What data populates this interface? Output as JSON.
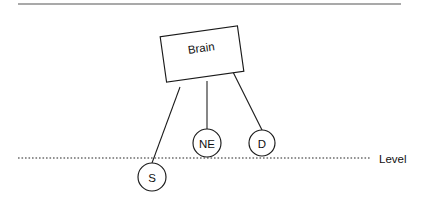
{
  "figure": {
    "background_color": "#ffffff",
    "stroke_color": "#1a1a1a",
    "text_color": "#111111",
    "width": 421,
    "height": 207
  },
  "top_rule": {
    "name": "top-divider",
    "color": "#8d8d8d",
    "x1": 18,
    "y1": 4,
    "x2": 401,
    "y2": 4
  },
  "brain_box": {
    "label": "Brain",
    "rotation_deg": -8,
    "center_x": 202,
    "center_y": 54,
    "width": 78,
    "height": 46,
    "fill": "#ffffff",
    "stroke": "#1a1a1a"
  },
  "nodes": [
    {
      "id": "S",
      "label": "S",
      "cx": 152,
      "cy": 177,
      "r": 14,
      "position_vs_level": "below",
      "fill": "#ffffff",
      "stroke": "#1a1a1a"
    },
    {
      "id": "NE",
      "label": "NE",
      "cx": 207,
      "cy": 143,
      "r": 14,
      "position_vs_level": "above",
      "fill": "#ffffff",
      "stroke": "#1a1a1a"
    },
    {
      "id": "D",
      "label": "D",
      "cx": 262,
      "cy": 143,
      "r": 13,
      "position_vs_level": "above",
      "fill": "#ffffff",
      "stroke": "#1a1a1a"
    }
  ],
  "links": [
    {
      "from": "Brain",
      "to": "S",
      "x1": 180,
      "y1": 87,
      "x2": 152,
      "y2": 163
    },
    {
      "from": "Brain",
      "to": "NE",
      "x1": 207,
      "y1": 81,
      "x2": 207,
      "y2": 129
    },
    {
      "from": "Brain",
      "to": "D",
      "x1": 233,
      "y1": 72,
      "x2": 262,
      "y2": 130
    }
  ],
  "level": {
    "label": "Level",
    "y": 158,
    "x_start": 18,
    "x_end": 370,
    "label_x": 379,
    "label_y": 158,
    "style": "dotted",
    "color": "#262626"
  }
}
